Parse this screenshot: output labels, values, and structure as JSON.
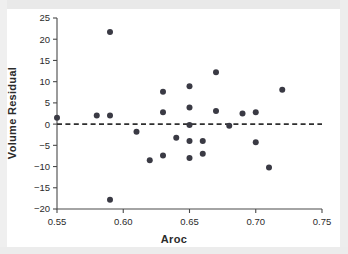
{
  "figure": {
    "name": "volume-residual-vs-aroc-scatter"
  },
  "chart_data": {
    "type": "scatter",
    "title": "",
    "subtitle": "",
    "xlabel": "Aroc",
    "ylabel": "Volume Residual",
    "xlim": [
      0.55,
      0.75
    ],
    "ylim": [
      -20,
      25
    ],
    "xticks": [
      0.55,
      0.6,
      0.65,
      0.7,
      0.75
    ],
    "xticklabels": [
      "0.55",
      "0.60",
      "0.65",
      "0.70",
      "0.75"
    ],
    "yticks": [
      -20,
      -15,
      -10,
      -5,
      0,
      5,
      10,
      15,
      20,
      25
    ],
    "yticklabels": [
      "−20",
      "−15",
      "−10",
      "−5",
      "0",
      "5",
      "10",
      "15",
      "20",
      "25"
    ],
    "grid": false,
    "legend": null,
    "legend_position": "none",
    "marker": "filled-circle",
    "marker_color": "#3a3a44",
    "marker_size_px": 3.0,
    "reference_line": {
      "name": "zero-residual-line",
      "orientation": "horizontal",
      "y": 0,
      "style": "dashed",
      "color": "#2e2e2e"
    },
    "n_points": 27,
    "x": [
      0.55,
      0.58,
      0.59,
      0.59,
      0.59,
      0.61,
      0.62,
      0.63,
      0.63,
      0.63,
      0.63,
      0.64,
      0.65,
      0.65,
      0.65,
      0.65,
      0.65,
      0.66,
      0.66,
      0.66,
      0.67,
      0.67,
      0.68,
      0.69,
      0.7,
      0.7,
      0.71,
      0.72
    ],
    "y": [
      1.5,
      2.0,
      21.7,
      2.0,
      -17.8,
      -1.8,
      -8.5,
      7.6,
      2.8,
      -7.4,
      -7.4,
      -3.2,
      8.9,
      3.9,
      -0.2,
      -4.0,
      -8.0,
      -4.0,
      -7.0,
      -7.0,
      12.2,
      3.1,
      -0.4,
      2.5,
      2.8,
      -4.3,
      -10.2,
      8.1
    ],
    "points": [
      {
        "x": 0.55,
        "y": 1.5
      },
      {
        "x": 0.58,
        "y": 2.0
      },
      {
        "x": 0.59,
        "y": 21.7
      },
      {
        "x": 0.59,
        "y": 2.0
      },
      {
        "x": 0.59,
        "y": -17.8
      },
      {
        "x": 0.61,
        "y": -1.8
      },
      {
        "x": 0.62,
        "y": -8.5
      },
      {
        "x": 0.63,
        "y": 7.6
      },
      {
        "x": 0.63,
        "y": 2.8
      },
      {
        "x": 0.63,
        "y": -7.4
      },
      {
        "x": 0.64,
        "y": -3.2
      },
      {
        "x": 0.65,
        "y": 8.9
      },
      {
        "x": 0.65,
        "y": 3.9
      },
      {
        "x": 0.65,
        "y": -0.2
      },
      {
        "x": 0.65,
        "y": -4.0
      },
      {
        "x": 0.65,
        "y": -8.0
      },
      {
        "x": 0.66,
        "y": -4.0
      },
      {
        "x": 0.66,
        "y": -7.0
      },
      {
        "x": 0.67,
        "y": 12.2
      },
      {
        "x": 0.67,
        "y": 3.1
      },
      {
        "x": 0.68,
        "y": -0.4
      },
      {
        "x": 0.69,
        "y": 2.5
      },
      {
        "x": 0.7,
        "y": 2.8
      },
      {
        "x": 0.7,
        "y": -4.3
      },
      {
        "x": 0.71,
        "y": -10.2
      },
      {
        "x": 0.72,
        "y": 8.1
      }
    ]
  },
  "colors": {
    "marker": "#3a3a44",
    "axis": "#4a4a4a",
    "text": "#2b2b2b",
    "reference_line": "#2e2e2e",
    "background": "#ffffff"
  }
}
